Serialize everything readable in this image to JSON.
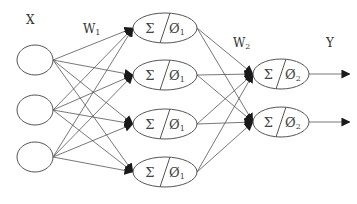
{
  "diagram": {
    "type": "neural-network",
    "labels": {
      "input": "X",
      "weights1": "W",
      "weights1_sub": "1",
      "weights2": "W",
      "weights2_sub": "2",
      "output": "Y"
    },
    "layers": [
      {
        "name": "input",
        "nodes": [
          {
            "id": "x1",
            "cx": 35,
            "cy": 60,
            "rx": 18,
            "ry": 15
          },
          {
            "id": "x2",
            "cx": 35,
            "cy": 110,
            "rx": 18,
            "ry": 15
          },
          {
            "id": "x3",
            "cx": 35,
            "cy": 157,
            "rx": 18,
            "ry": 15
          }
        ]
      },
      {
        "name": "hidden",
        "sum_symbol": "Σ",
        "activation_symbol": "Ø",
        "activation_sub": "1",
        "nodes": [
          {
            "id": "h1",
            "cx": 165,
            "cy": 28,
            "rx": 32,
            "ry": 15
          },
          {
            "id": "h2",
            "cx": 165,
            "cy": 75,
            "rx": 32,
            "ry": 15
          },
          {
            "id": "h3",
            "cx": 165,
            "cy": 124,
            "rx": 32,
            "ry": 15
          },
          {
            "id": "h4",
            "cx": 165,
            "cy": 172,
            "rx": 32,
            "ry": 15
          }
        ]
      },
      {
        "name": "output",
        "sum_symbol": "Σ",
        "activation_symbol": "Ø",
        "activation_sub": "2",
        "nodes": [
          {
            "id": "y1",
            "cx": 281,
            "cy": 74,
            "rx": 28,
            "ry": 15
          },
          {
            "id": "y2",
            "cx": 281,
            "cy": 122,
            "rx": 28,
            "ry": 15
          }
        ]
      }
    ],
    "output_arrow_end_x": 350,
    "colors": {
      "stroke": "#555555",
      "arrowhead": "#1a1a1a",
      "text": "#333333"
    }
  }
}
